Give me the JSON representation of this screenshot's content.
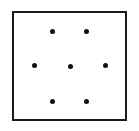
{
  "figure": {
    "canvas": {
      "width": 139,
      "height": 131,
      "background": "#ffffff"
    },
    "panel": {
      "name": "square-frame",
      "x": 12,
      "y": 11,
      "width": 115,
      "height": 110,
      "border_width": 2,
      "border_color": "#1a1a1a",
      "fill": "#ffffff"
    },
    "dot_style": {
      "diameter": 5,
      "color": "#111111",
      "shape": "circle"
    },
    "dots": [
      {
        "id": "dot-top-left",
        "label": "1",
        "cx": 52,
        "cy": 31,
        "row": "top",
        "col": "left"
      },
      {
        "id": "dot-top-right",
        "label": "2",
        "cx": 86,
        "cy": 31,
        "row": "top",
        "col": "right"
      },
      {
        "id": "dot-middle-left",
        "label": "3",
        "cx": 34,
        "cy": 65,
        "row": "middle",
        "col": "left"
      },
      {
        "id": "dot-middle-center",
        "label": "4",
        "cx": 70,
        "cy": 66,
        "row": "middle",
        "col": "center"
      },
      {
        "id": "dot-middle-right",
        "label": "5",
        "cx": 105,
        "cy": 65,
        "row": "middle",
        "col": "right"
      },
      {
        "id": "dot-bottom-left",
        "label": "6",
        "cx": 52,
        "cy": 101,
        "row": "bottom",
        "col": "left"
      },
      {
        "id": "dot-bottom-right",
        "label": "7",
        "cx": 86,
        "cy": 101,
        "row": "bottom",
        "col": "right"
      }
    ],
    "dot_count": 7
  }
}
